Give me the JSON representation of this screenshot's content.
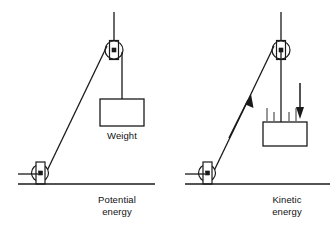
{
  "figure": {
    "title": "",
    "width": 335,
    "height": 230,
    "background": "#ffffff",
    "stroke_color": "#1a1a1a",
    "text_color": "#111111"
  },
  "panels": [
    {
      "id": "left",
      "caption_line1": "Potential",
      "caption_line2": "energy",
      "weight_label": "Weight",
      "has_motion_arrows": false,
      "has_motion_lines": false
    },
    {
      "id": "right",
      "caption_line1": "Kinetic",
      "caption_line2": "energy",
      "weight_label": "",
      "has_motion_arrows": true,
      "has_motion_lines": true
    }
  ],
  "icons": {
    "pulley": "pulley-icon",
    "weight_block": "weight-block-icon",
    "ground": "ground-line-icon",
    "arrow_up": "arrow-up-icon",
    "arrow_down": "arrow-down-icon",
    "rope": "rope-line-icon",
    "motion_lines": "motion-lines-icon"
  }
}
